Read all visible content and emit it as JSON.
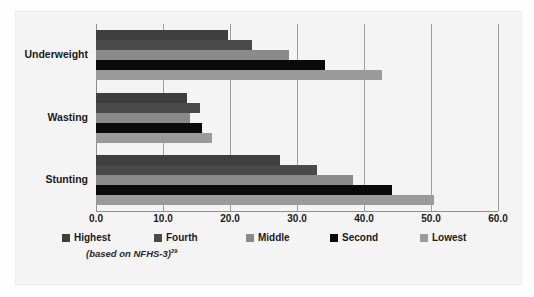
{
  "chart_data": {
    "type": "bar",
    "orientation": "horizontal",
    "title": "",
    "subtitle": "",
    "xlabel": "",
    "ylabel": "",
    "xlim": [
      0.0,
      60.0
    ],
    "xticks": [
      "0.0",
      "10.0",
      "20.0",
      "30.0",
      "40.0",
      "50.0",
      "60.0"
    ],
    "xtick_values": [
      0,
      10,
      20,
      30,
      40,
      50,
      60
    ],
    "grid": true,
    "legend_position": "bottom",
    "categories": [
      "Underweight",
      "Wasting",
      "Stunting"
    ],
    "series": [
      {
        "name": "Highest",
        "color": "#3f3f3f",
        "values": [
          19.7,
          13.6,
          27.5
        ]
      },
      {
        "name": "Fourth",
        "color": "#4a4a4a",
        "values": [
          23.3,
          15.5,
          33.0
        ]
      },
      {
        "name": "Middle",
        "color": "#8a8a8a",
        "values": [
          28.8,
          14.0,
          38.4
        ]
      },
      {
        "name": "Second",
        "color": "#0a0a0a",
        "values": [
          34.2,
          15.8,
          44.2
        ]
      },
      {
        "name": "Lowest",
        "color": "#9a9a9a",
        "values": [
          42.7,
          17.3,
          50.4
        ]
      }
    ],
    "annotation": "(based on NFHS-3)",
    "annotation_superscript": "29"
  },
  "legend": {
    "items": [
      {
        "label": "Highest",
        "color": "#3f3f3f"
      },
      {
        "label": "Fourth",
        "color": "#4a4a4a"
      },
      {
        "label": "Middle",
        "color": "#8a8a8a"
      },
      {
        "label": "Second",
        "color": "#0a0a0a"
      },
      {
        "label": "Lowest",
        "color": "#9a9a9a"
      }
    ]
  },
  "colors": {
    "panel_background": "#f4f4f4",
    "gridline": "#9e9e9e",
    "text": "#1a1a1a"
  }
}
